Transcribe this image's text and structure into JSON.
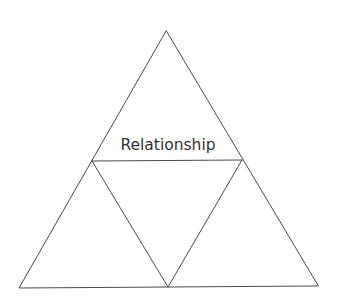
{
  "diagram": {
    "type": "subdivided-triangle",
    "sections": [
      {
        "id": "top",
        "label": "Relationship"
      },
      {
        "id": "center",
        "label": ""
      },
      {
        "id": "bottom-left",
        "label": ""
      },
      {
        "id": "bottom-right",
        "label": ""
      }
    ],
    "colors": {
      "line": "#4a4a4a",
      "text": "#333333",
      "background": "#ffffff"
    }
  }
}
